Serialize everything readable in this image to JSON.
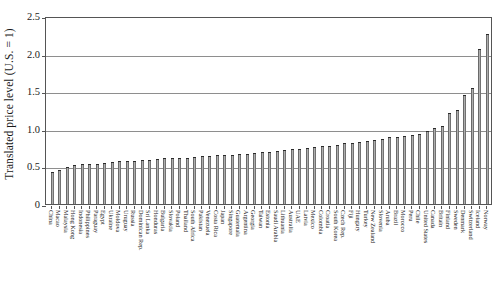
{
  "chart_data": {
    "type": "bar",
    "title": "",
    "subtitle": "",
    "xlabel": "",
    "ylabel": "Translated price level (U.S. = 1)",
    "ylim": [
      0,
      2.5
    ],
    "yticks": [
      "0",
      "0.5",
      "1.0",
      "1.5",
      "2.0",
      "2.5"
    ],
    "ytick_values": [
      0,
      0.5,
      1.0,
      1.5,
      2.0,
      2.5
    ],
    "grid": true,
    "legend": "none",
    "series_name": "Translated price level",
    "bar_color": "#808080",
    "categories": [
      "China",
      "Macao",
      "Malaysia",
      "Hong Kong",
      "Indonesia",
      "Philippines",
      "Paraguay",
      "Egypt",
      "Ukraine",
      "Moldova",
      "Uruguay",
      "Russia",
      "Dominican Rep.",
      "Sri Lanka",
      "Honduras",
      "Bulgaria",
      "Slovakia",
      "Poland",
      "Thailand",
      "South Africa",
      "Pakistan",
      "Venezuela",
      "Costa Rica",
      "Japan",
      "Singapore",
      "Guatemala",
      "Argentina",
      "Georgia",
      "Taiwan",
      "Estonia",
      "Saudi Arabia",
      "Lithuania",
      "Australia",
      "UAE",
      "Latvia",
      "Mexico",
      "Colombia",
      "Croatia",
      "South Korea",
      "Czech Rep.",
      "Fiji",
      "Hungary",
      "Turkey",
      "New Zealand",
      "Slovenia",
      "Aruba",
      "Brazil",
      "Morocco",
      "Peru",
      "Chile",
      "United States",
      "Canada",
      "Britain",
      "Finland",
      "Sweden",
      "Denmark",
      "Switzerland",
      "Iceland",
      "Norway"
    ],
    "values": [
      0.44,
      0.46,
      0.51,
      0.53,
      0.54,
      0.55,
      0.55,
      0.56,
      0.57,
      0.58,
      0.58,
      0.59,
      0.6,
      0.6,
      0.61,
      0.62,
      0.62,
      0.63,
      0.63,
      0.64,
      0.65,
      0.65,
      0.66,
      0.66,
      0.67,
      0.68,
      0.68,
      0.69,
      0.7,
      0.71,
      0.72,
      0.73,
      0.74,
      0.75,
      0.76,
      0.77,
      0.78,
      0.79,
      0.8,
      0.82,
      0.83,
      0.84,
      0.85,
      0.87,
      0.88,
      0.9,
      0.91,
      0.92,
      0.93,
      0.95,
      0.99,
      1.02,
      1.05,
      1.22,
      1.26,
      1.46,
      1.55,
      2.07,
      2.28
    ]
  }
}
